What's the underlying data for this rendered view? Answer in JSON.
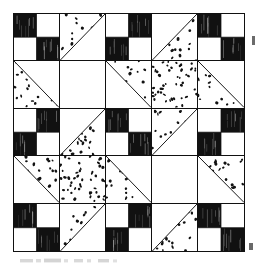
{
  "figure": {
    "kind": "quilt-block-diagram",
    "grid_rows": 5,
    "grid_columns": 5,
    "colors": {
      "dark_fabric": "#111111",
      "light_fabric": "#ffffff",
      "print_dot": "#121212",
      "outline": "#111111",
      "background": "#ffffff"
    },
    "unit_legend": [
      {
        "key": "four-patch-dark-first",
        "label": "Four-patch, dark upper-left"
      },
      {
        "key": "four-patch-light-first",
        "label": "Four-patch, light upper-left"
      },
      {
        "key": "hst-print-upper-left",
        "label": "Half-square triangle, print upper-left"
      },
      {
        "key": "hst-print-upper-right",
        "label": "Half-square triangle, print upper-right"
      },
      {
        "key": "hst-print-lower-left",
        "label": "Half-square triangle, print lower-left"
      },
      {
        "key": "hst-print-lower-right",
        "label": "Half-square triangle, print lower-right"
      },
      {
        "key": "print-square",
        "label": "Whole print square"
      },
      {
        "key": "plain-square",
        "label": "Plain light square"
      }
    ],
    "cells": [
      {
        "r": 1,
        "c": 1,
        "unit": "four-patch-dark-first"
      },
      {
        "r": 1,
        "c": 2,
        "unit": "hst-print-upper-left"
      },
      {
        "r": 1,
        "c": 3,
        "unit": "four-patch-light-first"
      },
      {
        "r": 1,
        "c": 4,
        "unit": "hst-print-lower-right"
      },
      {
        "r": 1,
        "c": 5,
        "unit": "four-patch-dark-first"
      },
      {
        "r": 2,
        "c": 1,
        "unit": "hst-print-lower-left"
      },
      {
        "r": 2,
        "c": 2,
        "unit": "plain-square"
      },
      {
        "r": 2,
        "c": 3,
        "unit": "hst-print-upper-right"
      },
      {
        "r": 2,
        "c": 4,
        "unit": "print-square"
      },
      {
        "r": 2,
        "c": 5,
        "unit": "hst-print-lower-left"
      },
      {
        "r": 3,
        "c": 1,
        "unit": "four-patch-light-first"
      },
      {
        "r": 3,
        "c": 2,
        "unit": "hst-print-lower-right"
      },
      {
        "r": 3,
        "c": 3,
        "unit": "four-patch-dark-first"
      },
      {
        "r": 3,
        "c": 4,
        "unit": "hst-print-upper-left"
      },
      {
        "r": 3,
        "c": 5,
        "unit": "four-patch-light-first"
      },
      {
        "r": 4,
        "c": 1,
        "unit": "hst-print-upper-right"
      },
      {
        "r": 4,
        "c": 2,
        "unit": "print-square"
      },
      {
        "r": 4,
        "c": 3,
        "unit": "hst-print-lower-left"
      },
      {
        "r": 4,
        "c": 4,
        "unit": "plain-square"
      },
      {
        "r": 4,
        "c": 5,
        "unit": "hst-print-upper-right"
      },
      {
        "r": 5,
        "c": 1,
        "unit": "four-patch-dark-first"
      },
      {
        "r": 5,
        "c": 2,
        "unit": "hst-print-upper-left"
      },
      {
        "r": 5,
        "c": 3,
        "unit": "four-patch-light-first"
      },
      {
        "r": 5,
        "c": 4,
        "unit": "hst-print-lower-right"
      },
      {
        "r": 5,
        "c": 5,
        "unit": "four-patch-dark-first"
      }
    ]
  }
}
